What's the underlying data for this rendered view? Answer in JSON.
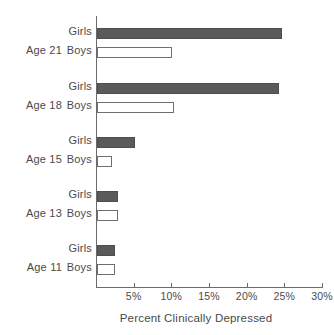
{
  "chart_data": {
    "type": "bar",
    "orientation": "horizontal",
    "title": "",
    "xlabel": "Percent Clinically Depressed",
    "ylabel": "",
    "xlim": [
      0,
      30
    ],
    "grid": false,
    "legend_position": "none",
    "categories": [
      "Age 21",
      "Age 18",
      "Age 15",
      "Age 13",
      "Age 11"
    ],
    "series": [
      {
        "name": "Girls",
        "values": [
          24.6,
          24.2,
          5.0,
          2.8,
          2.4
        ],
        "color": "#5a5a5a"
      },
      {
        "name": "Boys",
        "values": [
          10.0,
          10.2,
          2.0,
          2.8,
          2.4
        ],
        "color": "#ffffff"
      }
    ],
    "x_ticks": [
      {
        "value": 5,
        "label": "5%"
      },
      {
        "value": 10,
        "label": "10%"
      },
      {
        "value": 15,
        "label": "15%"
      },
      {
        "value": 20,
        "label": "20%"
      },
      {
        "value": 25,
        "label": "25%"
      },
      {
        "value": 30,
        "label": "30%"
      }
    ]
  },
  "groups": [
    {
      "age_label": "Age 21",
      "girls_label": "Girls",
      "boys_label": "Boys",
      "girls_value": 24.6,
      "boys_value": 10.0
    },
    {
      "age_label": "Age 18",
      "girls_label": "Girls",
      "boys_label": "Boys",
      "girls_value": 24.2,
      "boys_value": 10.2
    },
    {
      "age_label": "Age 15",
      "girls_label": "Girls",
      "boys_label": "Boys",
      "girls_value": 5.0,
      "boys_value": 2.0
    },
    {
      "age_label": "Age 13",
      "girls_label": "Girls",
      "boys_label": "Boys",
      "girls_value": 2.8,
      "boys_value": 2.8
    },
    {
      "age_label": "Age 11",
      "girls_label": "Girls",
      "boys_label": "Boys",
      "girls_value": 2.4,
      "boys_value": 2.4
    }
  ],
  "x_axis": {
    "ticks": [
      "5%",
      "10%",
      "15%",
      "20%",
      "25%",
      "30%"
    ],
    "tick_values": [
      5,
      10,
      15,
      20,
      25,
      30
    ],
    "title": "Percent Clinically Depressed"
  },
  "colors": {
    "girls_fill": "#5a5a5a",
    "boys_fill": "#ffffff",
    "bar_stroke": "#6f6f6f",
    "axis": "#6b6b6b",
    "text": "#4a4a4a"
  }
}
